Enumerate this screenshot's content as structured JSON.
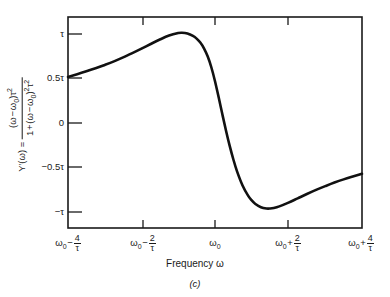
{
  "figure": {
    "caption": "(c)",
    "xaxis_title_prefix": "Frequency ",
    "xaxis_title_symbol": "ω"
  },
  "yaxis_label": {
    "lhs": "Y′(ω) =",
    "numerator_main": "(ω − ω",
    "numerator_sub": "0",
    "numerator_close": ")τ",
    "numerator_sup": "2",
    "denominator_lead": "1 + (ω − ω",
    "denominator_sub": "0",
    "denominator_close": ")",
    "denominator_sup1": "2",
    "denominator_tau": "τ",
    "denominator_sup2": "2"
  },
  "chart_data": {
    "type": "line",
    "title": "",
    "subtitle": "",
    "xlabel": "Frequency ω",
    "ylabel": "Y′(ω) = (ω − ω₀)τ² / [1 + (ω − ω₀)²τ²]",
    "grid": false,
    "legend": false,
    "xlim": [
      -4,
      4
    ],
    "ylim": [
      -1.18,
      1.18
    ],
    "x_unit": "1/τ offset from ω₀",
    "y_unit": "τ",
    "xticks": [
      -4,
      -2,
      0,
      2,
      4
    ],
    "xticklabels": [
      {
        "base": "ω",
        "sub": "0",
        "op": "−",
        "num": "4",
        "den": "τ"
      },
      {
        "base": "ω",
        "sub": "0",
        "op": "−",
        "num": "2",
        "den": "τ"
      },
      {
        "base": "ω",
        "sub": "0",
        "op": "",
        "num": "",
        "den": ""
      },
      {
        "base": "ω",
        "sub": "0",
        "op": "+",
        "num": "2",
        "den": "τ"
      },
      {
        "base": "ω",
        "sub": "0",
        "op": "+",
        "num": "4",
        "den": "τ"
      }
    ],
    "yticks": [
      1,
      0.5,
      0,
      -0.5,
      -1
    ],
    "yticklabels": [
      "τ",
      "0.5τ",
      "0",
      "−0.5τ",
      "−τ"
    ],
    "series": [
      {
        "name": "Y′(ω)",
        "color": "#111111",
        "x": [
          -4.0,
          -3.75,
          -3.5,
          -3.25,
          -3.0,
          -2.75,
          -2.5,
          -2.25,
          -2.0,
          -1.75,
          -1.5,
          -1.25,
          -1.0,
          -0.9,
          -0.75,
          -0.6,
          -0.5,
          -0.4,
          -0.3,
          -0.2,
          -0.1,
          0.0,
          0.1,
          0.2,
          0.3,
          0.4,
          0.5,
          0.6,
          0.75,
          0.9,
          1.0,
          1.1,
          1.25,
          1.4,
          1.5,
          1.6,
          1.75,
          2.0,
          2.25,
          2.5,
          2.75,
          3.0,
          3.25,
          3.5,
          3.75,
          4.0
        ],
        "y": [
          0.51,
          0.54,
          0.572,
          0.606,
          0.644,
          0.684,
          0.728,
          0.776,
          0.826,
          0.878,
          0.928,
          0.972,
          1.0,
          1.004,
          0.995,
          0.968,
          0.938,
          0.894,
          0.83,
          0.74,
          0.618,
          0.462,
          0.282,
          0.092,
          -0.092,
          -0.262,
          -0.414,
          -0.546,
          -0.704,
          -0.818,
          -0.872,
          -0.912,
          -0.948,
          -0.962,
          -0.962,
          -0.956,
          -0.938,
          -0.896,
          -0.848,
          -0.8,
          -0.754,
          -0.712,
          -0.672,
          -0.636,
          -0.604,
          -0.574
        ]
      }
    ],
    "annotations": {
      "peak": {
        "x": -0.9,
        "y": 1.0,
        "label": "maximum ≈ τ"
      },
      "trough": {
        "x": 1.45,
        "y": -0.96,
        "label": "minimum ≈ −τ"
      },
      "zero_crossing": {
        "x": 0.25,
        "y": 0.0,
        "label": "crosses zero near ω₀"
      }
    }
  }
}
